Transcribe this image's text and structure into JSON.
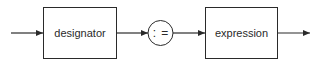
{
  "diagram": {
    "type": "syntax-diagram",
    "nodes": [
      {
        "id": "designator",
        "kind": "nonterminal",
        "label": "designator"
      },
      {
        "id": "assign",
        "kind": "terminal",
        "label": ": ="
      },
      {
        "id": "expression",
        "kind": "nonterminal",
        "label": "expression"
      }
    ],
    "edges": [
      {
        "from": "entry",
        "to": "designator"
      },
      {
        "from": "designator",
        "to": "assign"
      },
      {
        "from": "assign",
        "to": "expression"
      },
      {
        "from": "expression",
        "to": "exit"
      }
    ]
  }
}
